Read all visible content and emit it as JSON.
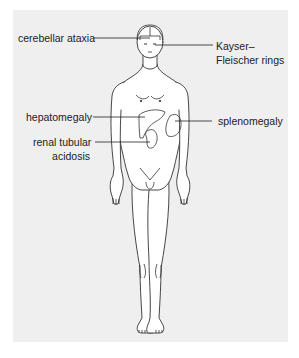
{
  "diagram": {
    "type": "anatomical-figure",
    "background_color": "#efefef",
    "line_color": "#333333",
    "labels": [
      {
        "id": "cerebellar-ataxia",
        "text": "cerebellar ataxia",
        "side": "left",
        "target": "head"
      },
      {
        "id": "kayser-fleischer",
        "line1": "Kayser–",
        "line2": "Fleischer rings",
        "side": "right",
        "target": "eyes"
      },
      {
        "id": "hepatomegaly",
        "text": "hepatomegaly",
        "side": "left",
        "target": "liver"
      },
      {
        "id": "renal-tubular-acidosis",
        "line1": "renal tubular",
        "line2": "acidosis",
        "side": "left",
        "target": "kidney"
      },
      {
        "id": "splenomegaly",
        "text": "splenomegaly",
        "side": "right",
        "target": "spleen"
      }
    ]
  }
}
